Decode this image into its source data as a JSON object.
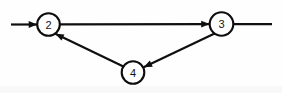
{
  "diagram": {
    "type": "directed-graph",
    "background_color": "#fefefe",
    "stroke_color": "#100f0f",
    "node_fill_color": "#ffffff",
    "label_color": "#141414",
    "nodes": [
      {
        "id": "2",
        "label": "2",
        "cx": 48.5,
        "cy": 24.5,
        "r": 11.3,
        "stroke_width": 2.1
      },
      {
        "id": "3",
        "label": "3",
        "cx": 221.5,
        "cy": 24.0,
        "r": 11.8,
        "stroke_width": 2.1
      },
      {
        "id": "4",
        "label": "4",
        "cx": 133.0,
        "cy": 72.5,
        "r": 11.3,
        "stroke_width": 2.1
      }
    ],
    "edges": [
      {
        "id": "edge-in-to-2",
        "from": "",
        "to": "2",
        "arrow": true,
        "description": "incoming line from left border into node 2",
        "x1": 11,
        "y1": 24.5,
        "x2": 37.2,
        "y2": 24.5,
        "stroke_width": 2.2
      },
      {
        "id": "edge-2-to-3",
        "from": "2",
        "to": "3",
        "arrow": true,
        "description": "horizontal edge from node 2 to node 3",
        "x1": 59.8,
        "y1": 24.3,
        "x2": 209.7,
        "y2": 24.1,
        "stroke_width": 2.2
      },
      {
        "id": "edge-4-to-2",
        "from": "4",
        "to": "2",
        "arrow": true,
        "description": "diagonal edge from node 4 up-left into node 2",
        "x1": 123.4,
        "y1": 66.4,
        "x2": 55.3,
        "y2": 33.8,
        "stroke_width": 2.2
      },
      {
        "id": "edge-3-to-4",
        "from": "3",
        "to": "4",
        "arrow": true,
        "description": "diagonal edge from node 3 down-left into node 4",
        "x1": 214.6,
        "y1": 33.5,
        "x2": 143.6,
        "y2": 67.3,
        "stroke_width": 2.2
      },
      {
        "id": "edge-3-to-out",
        "from": "3",
        "to": "",
        "arrow": false,
        "description": "outgoing line from node 3 to right border, no arrowhead",
        "x1": 233.3,
        "y1": 24.1,
        "x2": 272.0,
        "y2": 24.1,
        "stroke_width": 2.2
      }
    ]
  }
}
